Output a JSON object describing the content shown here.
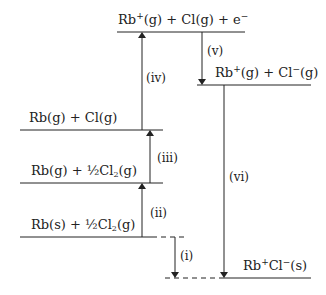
{
  "diagram": {
    "levels": [
      {
        "id": "top",
        "text": "Rb⁺(g) + Cl(g) + e⁻"
      },
      {
        "id": "ions",
        "text": "Rb⁺(g) + Cl⁻(g)"
      },
      {
        "id": "atoms",
        "text": "Rb(g) + Cl(g)"
      },
      {
        "id": "rbgas",
        "text": "Rb(g) + ½Cl₂(g)"
      },
      {
        "id": "elements",
        "text": "Rb(s) + ½Cl₂(g)"
      },
      {
        "id": "solid",
        "text": "Rb⁺Cl⁻(s)"
      }
    ],
    "steps": [
      {
        "id": "i",
        "label": "(i)",
        "direction": "down"
      },
      {
        "id": "ii",
        "label": "(ii)",
        "direction": "up"
      },
      {
        "id": "iii",
        "label": "(iii)",
        "direction": "up"
      },
      {
        "id": "iv",
        "label": "(iv)",
        "direction": "up"
      },
      {
        "id": "v",
        "label": "(v)",
        "direction": "down"
      },
      {
        "id": "vi",
        "label": "(vi)",
        "direction": "down"
      }
    ],
    "line_color": "#222222"
  },
  "labels": {
    "top_rb": "Rb",
    "top_plus": "+",
    "top_rest": "(g) + Cl(g) + e",
    "top_minus": "−",
    "ions_rb": "Rb",
    "ions_plus": "+",
    "ions_mid": "(g) + Cl",
    "ions_minus": "−",
    "ions_end": "(g)",
    "atoms": "Rb(g) + Cl(g)",
    "rbgas_a": "Rb(g) + ½Cl",
    "rbgas_sub": "2",
    "rbgas_b": "(g)",
    "elements_a": "Rb(s) + ½Cl",
    "elements_sub": "2",
    "elements_b": "(g)",
    "solid_rb": "Rb",
    "solid_plus": "+",
    "solid_cl": "Cl",
    "solid_minus": "−",
    "solid_end": "(s)",
    "step_i": "(i)",
    "step_ii": "(ii)",
    "step_iii": "(iii)",
    "step_iv": "(iv)",
    "step_v": "(v)",
    "step_vi": "(vi)"
  }
}
